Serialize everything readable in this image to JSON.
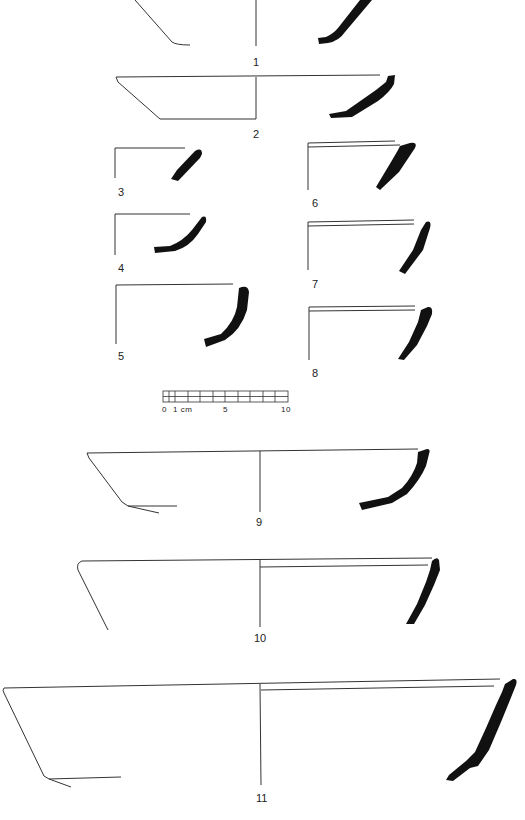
{
  "figure": {
    "type": "pottery profile drawings",
    "ink_color": "#111111",
    "line_color": "#333333",
    "vessels": [
      {
        "number": "1",
        "label": "1"
      },
      {
        "number": "2",
        "label": "2"
      },
      {
        "number": "3",
        "label": "3"
      },
      {
        "number": "4",
        "label": "4"
      },
      {
        "number": "5",
        "label": "5"
      },
      {
        "number": "6",
        "label": "6"
      },
      {
        "number": "7",
        "label": "7"
      },
      {
        "number": "8",
        "label": "8"
      },
      {
        "number": "9",
        "label": "9"
      },
      {
        "number": "10",
        "label": "10"
      },
      {
        "number": "11",
        "label": "11"
      }
    ],
    "scale_bar": {
      "label_0": "0",
      "label_1": "1 cm",
      "label_5": "5",
      "label_10": "10",
      "unit": "cm",
      "max": 10
    }
  }
}
